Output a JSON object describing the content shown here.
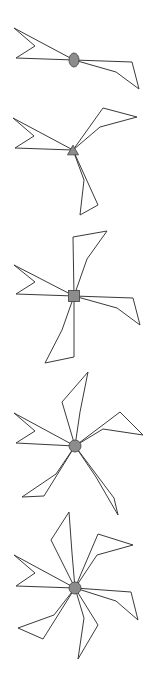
{
  "figure": {
    "background_color": "#ffffff",
    "stroke_color": "#3a3a3a",
    "hub_fill_color": "#8c8c8c",
    "hub_stroke_color": "#4a4a4a",
    "canvas": {
      "width": 162,
      "height": 679
    }
  },
  "chart_data": {
    "type": "scatter",
    "xlabel": "",
    "ylabel": "",
    "xlim": [
      0,
      162
    ],
    "ylim": [
      0,
      679
    ],
    "grid": false,
    "legend": "none",
    "series": [
      {
        "name": "figure-1",
        "arm_count": 2,
        "hub_marker": "ellipse",
        "hub_x": 74,
        "hub_y": 60,
        "hub_rx": 5,
        "hub_ry": 7,
        "arms": [
          "74,60 14,28 16,58 74,60",
          "74,60 132,62 139,89 74,60"
        ],
        "arm_detail": [
          "74,60 14,28 35,46 16,58 74,60",
          "74,60 132,62 139,89 116,72 74,60"
        ]
      },
      {
        "name": "figure-2",
        "arm_count": 3,
        "hub_marker": "triangle",
        "hub_x": 73,
        "hub_y": 150,
        "hub_size": 11,
        "arms": [
          "73,150 13,118 15,148 73,150",
          "73,150 103,108 137,117 73,150",
          "73,150 98,205 80,215 73,150"
        ],
        "arm_detail": [
          "73,150 13,118 34,136 15,148 73,150",
          "73,150 103,108 137,117 100,127 73,150",
          "73,150 98,205 80,215 84,180 73,150"
        ]
      },
      {
        "name": "figure-3",
        "arm_count": 4,
        "hub_marker": "square",
        "hub_x": 74,
        "hub_y": 296,
        "hub_size": 11,
        "arms": [
          "74,296 14,265 16,294 74,296",
          "74,296 73,237 107,231 74,296",
          "74,296 133,298 140,325 74,296",
          "74,296 74,357 45,363 74,296"
        ],
        "arm_detail": [
          "74,296 14,265 35,282 16,294 74,296",
          "74,296 73,237 107,231 87,259 74,296",
          "74,296 133,298 140,325 117,308 74,296",
          "74,296 74,357 45,363 62,330 74,296"
        ]
      },
      {
        "name": "figure-4",
        "arm_count": 5,
        "hub_marker": "circle",
        "hub_x": 75,
        "hub_y": 446,
        "hub_r": 6,
        "arms": [
          "75,446 14,413 16,443 75,446",
          "75,446 62,402 88,372 75,446",
          "75,446 120,412 143,435 75,446",
          "75,446 114,498 118,515 75,446",
          "75,446 44,496 22,497 75,446"
        ],
        "arm_detail": [
          "75,446 14,413 35,431 16,443 75,446",
          "75,446 62,402 88,372 80,412 75,446",
          "75,446 120,412 143,435 103,429 75,446",
          "75,446 114,498 118,515 96,477 75,446",
          "75,446 44,496 22,497 56,474 75,446"
        ]
      },
      {
        "name": "figure-5",
        "arm_count": 6,
        "hub_marker": "circle",
        "hub_x": 75,
        "hub_y": 588,
        "hub_r": 6,
        "arms": [
          "75,588 14,555 16,586 75,588",
          "75,588 51,540 69,512 75,588",
          "75,588 98,534 133,545 75,588",
          "75,588 131,592 138,620 75,588",
          "75,588 98,625 78,659 75,588",
          "75,588 43,639 18,628 75,588"
        ],
        "arm_detail": [
          "75,588 14,555 35,573 16,586 75,588",
          "75,588 51,540 69,512 72,553 75,588",
          "75,588 98,534 133,545 97,555 75,588",
          "75,588 131,592 138,620 116,601 75,588",
          "75,588 98,625 78,659 84,618 75,588",
          "75,588 43,639 18,628 54,615 75,588"
        ]
      }
    ]
  }
}
